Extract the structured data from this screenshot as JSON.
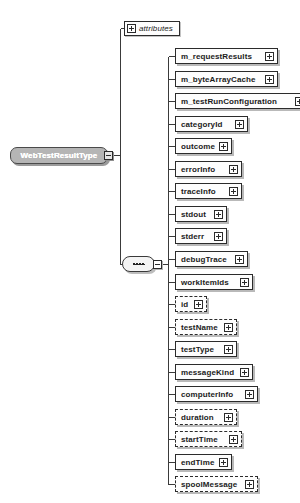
{
  "diagram": {
    "kind": "xml-schema-diagram",
    "background_color": "#ffffff",
    "line_color": "#3a3a3a",
    "node_fill": "#fdfdfd",
    "node_border": "#2b2b2b",
    "root_fill": "#b5b5b5",
    "root_text_color": "#ffffff"
  },
  "root": {
    "label": "WebTestResultType",
    "toggle": "minus",
    "toggle_icon": "collapse-minus-icon"
  },
  "attributes_node": {
    "label": "attributes",
    "toggle": "plus",
    "toggle_icon": "expand-plus-icon"
  },
  "sequence_node": {
    "label": "sequence",
    "icon": "sequence-dots-icon",
    "toggle": "minus",
    "toggle_icon": "collapse-minus-icon"
  },
  "elements": [
    {
      "label": "m_requestResults",
      "optional": false,
      "toggle": "plus",
      "toggle_icon": "expand-plus-icon"
    },
    {
      "label": "m_byteArrayCache",
      "optional": false,
      "toggle": "plus",
      "toggle_icon": "expand-plus-icon"
    },
    {
      "label": "m_testRunConfiguration",
      "optional": false,
      "toggle": "plus",
      "toggle_icon": "expand-plus-icon"
    },
    {
      "label": "categoryId",
      "optional": false,
      "toggle": "plus",
      "toggle_icon": "expand-plus-icon"
    },
    {
      "label": "outcome",
      "optional": false,
      "toggle": "plus",
      "toggle_icon": "expand-plus-icon"
    },
    {
      "label": "errorInfo",
      "optional": false,
      "toggle": "plus",
      "toggle_icon": "expand-plus-icon"
    },
    {
      "label": "traceInfo",
      "optional": false,
      "toggle": "plus",
      "toggle_icon": "expand-plus-icon"
    },
    {
      "label": "stdout",
      "optional": false,
      "toggle": "plus",
      "toggle_icon": "expand-plus-icon"
    },
    {
      "label": "stderr",
      "optional": false,
      "toggle": "plus",
      "toggle_icon": "expand-plus-icon"
    },
    {
      "label": "debugTrace",
      "optional": false,
      "toggle": "plus",
      "toggle_icon": "expand-plus-icon"
    },
    {
      "label": "workItemIds",
      "optional": false,
      "toggle": "plus",
      "toggle_icon": "expand-plus-icon"
    },
    {
      "label": "id",
      "optional": true,
      "toggle": "plus",
      "toggle_icon": "expand-plus-icon"
    },
    {
      "label": "testName",
      "optional": true,
      "toggle": "plus",
      "toggle_icon": "expand-plus-icon"
    },
    {
      "label": "testType",
      "optional": false,
      "toggle": "plus",
      "toggle_icon": "expand-plus-icon"
    },
    {
      "label": "messageKind",
      "optional": false,
      "toggle": "plus",
      "toggle_icon": "expand-plus-icon"
    },
    {
      "label": "computerInfo",
      "optional": false,
      "toggle": "plus",
      "toggle_icon": "expand-plus-icon"
    },
    {
      "label": "duration",
      "optional": true,
      "toggle": "plus",
      "toggle_icon": "expand-plus-icon"
    },
    {
      "label": "startTime",
      "optional": true,
      "toggle": "plus",
      "toggle_icon": "expand-plus-icon"
    },
    {
      "label": "endTime",
      "optional": false,
      "toggle": "plus",
      "toggle_icon": "expand-plus-icon"
    },
    {
      "label": "spoolMessage",
      "optional": true,
      "toggle": "plus",
      "toggle_icon": "expand-plus-icon"
    }
  ]
}
